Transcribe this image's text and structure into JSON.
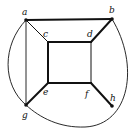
{
  "diagram": {
    "type": "graph",
    "nodes": [
      {
        "id": "a",
        "label": "a",
        "x": 26,
        "y": 20,
        "lx": 22,
        "ly": 15
      },
      {
        "id": "b",
        "label": "b",
        "x": 112,
        "y": 19,
        "lx": 109,
        "ly": 13
      },
      {
        "id": "c",
        "label": "c",
        "x": 48,
        "y": 42,
        "lx": 43,
        "ly": 37
      },
      {
        "id": "d",
        "label": "d",
        "x": 91,
        "y": 42,
        "lx": 87,
        "ly": 37
      },
      {
        "id": "e",
        "label": "e",
        "x": 48,
        "y": 83,
        "lx": 43,
        "ly": 95
      },
      {
        "id": "f",
        "label": "f",
        "x": 91,
        "y": 83,
        "lx": 85,
        "ly": 97
      },
      {
        "id": "g",
        "label": "g",
        "x": 26,
        "y": 105,
        "lx": 22,
        "ly": 118
      },
      {
        "id": "h",
        "label": "h",
        "x": 112,
        "y": 106,
        "lx": 110,
        "ly": 101
      }
    ],
    "edges": [
      {
        "from": "a",
        "to": "b",
        "weight": "thick"
      },
      {
        "from": "a",
        "to": "g",
        "weight": "thin"
      },
      {
        "from": "a",
        "to": "c",
        "weight": "thin"
      },
      {
        "from": "b",
        "to": "d",
        "weight": "thick"
      },
      {
        "from": "c",
        "to": "d",
        "weight": "thick"
      },
      {
        "from": "c",
        "to": "e",
        "weight": "thick"
      },
      {
        "from": "d",
        "to": "f",
        "weight": "thin"
      },
      {
        "from": "e",
        "to": "f",
        "weight": "thick"
      },
      {
        "from": "e",
        "to": "g",
        "weight": "thick"
      },
      {
        "from": "f",
        "to": "h",
        "weight": "thick"
      },
      {
        "from": "a",
        "to": "g",
        "weight": "thin",
        "curved": "left-arc"
      },
      {
        "from": "b",
        "to": "g",
        "weight": "thin",
        "curved": "right-bottom-arc"
      }
    ],
    "colors": {
      "stroke": "#111111",
      "background": "#ffffff"
    }
  }
}
